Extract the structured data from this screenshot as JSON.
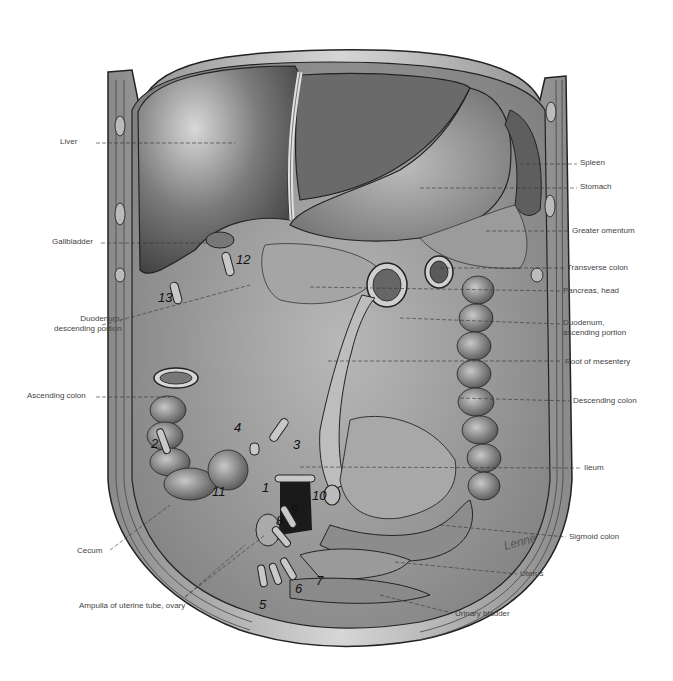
{
  "figure": {
    "labels_left": [
      {
        "id": "liver",
        "text": "Liver",
        "x": 94,
        "y": 142
      },
      {
        "id": "gallbladder",
        "text": "Gallbladder",
        "x": 99,
        "y": 242
      },
      {
        "id": "duodenum-descending",
        "text": "Duodenum,",
        "text2": "descending portion",
        "x": 100,
        "y": 322
      },
      {
        "id": "ascending-colon",
        "text": "Ascending colon",
        "x": 94,
        "y": 396
      },
      {
        "id": "cecum",
        "text": "Cecum",
        "x": 107,
        "y": 551
      },
      {
        "id": "ampulla",
        "text": "Ampulla of uterine tube, ovary",
        "x": 196,
        "y": 606
      }
    ],
    "labels_right": [
      {
        "id": "spleen",
        "text": "Spleen",
        "x": 580,
        "y": 163
      },
      {
        "id": "stomach",
        "text": "Stomach",
        "x": 580,
        "y": 187
      },
      {
        "id": "greater-omentum",
        "text": "Greater omentum",
        "x": 572,
        "y": 231
      },
      {
        "id": "transverse-colon",
        "text": "Transverse colon",
        "x": 567,
        "y": 268
      },
      {
        "id": "pancreas-head",
        "text": "Pancreas, head",
        "x": 563,
        "y": 291
      },
      {
        "id": "duodenum-ascending",
        "text": "Duodenum,",
        "text2": "ascending portion",
        "x": 563,
        "y": 322
      },
      {
        "id": "root-of-mesentery",
        "text": "Root of mesentery",
        "x": 565,
        "y": 362
      },
      {
        "id": "descending-colon",
        "text": "Descending colon",
        "x": 573,
        "y": 401
      },
      {
        "id": "ileum",
        "text": "Ileum",
        "x": 584,
        "y": 468
      },
      {
        "id": "sigmoid-colon",
        "text": "Sigmoid colon",
        "x": 569,
        "y": 537
      },
      {
        "id": "uterus",
        "text": "Uterus",
        "x": 520,
        "y": 574
      },
      {
        "id": "urinary-bladder",
        "text": "Urinary bladder",
        "x": 455,
        "y": 614
      }
    ],
    "numbers": [
      {
        "n": "1",
        "x": 262,
        "y": 490
      },
      {
        "n": "2",
        "x": 151,
        "y": 446
      },
      {
        "n": "3",
        "x": 293,
        "y": 447
      },
      {
        "n": "4",
        "x": 234,
        "y": 430
      },
      {
        "n": "5",
        "x": 259,
        "y": 607
      },
      {
        "n": "6",
        "x": 295,
        "y": 591
      },
      {
        "n": "7",
        "x": 316,
        "y": 583
      },
      {
        "n": "8",
        "x": 276,
        "y": 523
      },
      {
        "n": "9",
        "x": 291,
        "y": 512
      },
      {
        "n": "10",
        "x": 318,
        "y": 498
      },
      {
        "n": "11",
        "x": 214,
        "y": 494
      },
      {
        "n": "12",
        "x": 236,
        "y": 262
      },
      {
        "n": "13",
        "x": 160,
        "y": 300
      }
    ],
    "signature": "Lenné"
  }
}
